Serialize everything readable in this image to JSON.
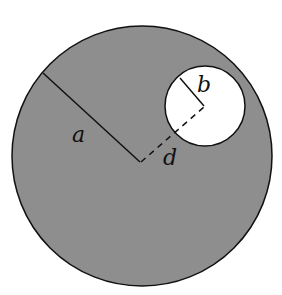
{
  "diagram": {
    "colors": {
      "large_fill": "#8e8e8e",
      "hole_fill": "#ffffff",
      "stroke": "#111111",
      "background": "#ffffff"
    },
    "large_circle": {
      "cx": 142,
      "cy": 156,
      "r": 130
    },
    "small_circle": {
      "cx": 205,
      "cy": 106,
      "r": 40
    },
    "labels": {
      "a": "a",
      "b": "b",
      "d": "d"
    }
  }
}
